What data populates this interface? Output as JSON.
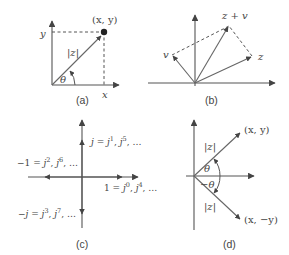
{
  "figure": {
    "panels": {
      "a": {
        "caption": "(a)",
        "point_label": "(x, y)",
        "x_label": "x",
        "y_label": "y",
        "magnitude_label": "|z|",
        "angle_label": "θ"
      },
      "b": {
        "caption": "(b)",
        "z_label": "z",
        "v_label": "v",
        "sum_label": "z + v"
      },
      "c": {
        "caption": "(c)",
        "pos_imag": {
          "lhs": "j",
          "eq": " = ",
          "b1": "j",
          "e1": "1",
          "sep": ", ",
          "b2": "j",
          "e2": "5",
          "tail": ", …"
        },
        "neg_real": {
          "lhs": "−1",
          "eq": " = ",
          "b1": "j",
          "e1": "2",
          "sep": ", ",
          "b2": "j",
          "e2": "6",
          "tail": ", …"
        },
        "pos_real": {
          "lhs": "1",
          "eq": " = ",
          "b1": "j",
          "e1": "0",
          "sep": ", ",
          "b2": "j",
          "e2": "4",
          "tail": ", …"
        },
        "neg_imag": {
          "lhs": "−j",
          "eq": " = ",
          "b1": "j",
          "e1": "3",
          "sep": ", ",
          "b2": "j",
          "e2": "7",
          "tail": ", …"
        }
      },
      "d": {
        "caption": "(d)",
        "upper_point_label": "(x, y)",
        "lower_point_label": "(x, −y)",
        "upper_magnitude_label": "|z|",
        "lower_magnitude_label": "|z|",
        "upper_angle_label": "θ",
        "lower_angle_label": "−θ"
      }
    }
  }
}
